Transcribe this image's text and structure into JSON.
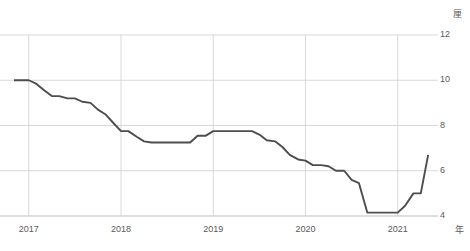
{
  "chart_data": {
    "type": "line",
    "title": "",
    "xlabel": "年",
    "ylabel": "厘",
    "unit_y": "厘",
    "unit_x": "年",
    "grid": true,
    "legend": "none",
    "xlim": [
      2016.84,
      2021.35
    ],
    "ylim": [
      4,
      12
    ],
    "yticks": [
      12,
      10,
      8,
      6,
      4
    ],
    "ytick_labels": [
      "12",
      "10",
      "8",
      "6",
      "4"
    ],
    "xticks": [
      2017,
      2018,
      2019,
      2020,
      2021
    ],
    "xtick_labels": [
      "2017",
      "2018",
      "2019",
      "2020",
      "2021"
    ],
    "series": [
      {
        "name": "金利",
        "color": "#4d4d4d",
        "x": [
          2016.84,
          2016.92,
          2017.0,
          2017.08,
          2017.17,
          2017.25,
          2017.33,
          2017.42,
          2017.5,
          2017.58,
          2017.67,
          2017.75,
          2017.83,
          2017.92,
          2018.0,
          2018.08,
          2018.17,
          2018.25,
          2018.33,
          2018.42,
          2018.5,
          2018.58,
          2018.67,
          2018.75,
          2018.83,
          2018.92,
          2019.0,
          2019.08,
          2019.17,
          2019.25,
          2019.33,
          2019.42,
          2019.5,
          2019.58,
          2019.67,
          2019.75,
          2019.83,
          2019.92,
          2020.0,
          2020.08,
          2020.17,
          2020.25,
          2020.33,
          2020.42,
          2020.5,
          2020.58,
          2020.67,
          2020.75,
          2020.83,
          2020.92,
          2021.0,
          2021.08,
          2021.17,
          2021.25,
          2021.33
        ],
        "y": [
          10.0,
          10.0,
          10.0,
          9.85,
          9.55,
          9.3,
          9.3,
          9.2,
          9.2,
          9.05,
          9.0,
          8.7,
          8.5,
          8.1,
          7.75,
          7.75,
          7.5,
          7.3,
          7.25,
          7.25,
          7.25,
          7.25,
          7.25,
          7.25,
          7.55,
          7.55,
          7.75,
          7.75,
          7.75,
          7.75,
          7.75,
          7.75,
          7.6,
          7.35,
          7.3,
          7.05,
          6.7,
          6.5,
          6.45,
          6.25,
          6.25,
          6.2,
          6.0,
          6.0,
          5.6,
          5.45,
          4.15,
          4.15,
          4.15,
          4.15,
          4.15,
          4.45,
          5.0,
          5.0,
          6.7
        ]
      }
    ],
    "annotations": []
  },
  "axis": {
    "unit_y_label": "厘",
    "unit_x_label": "年"
  },
  "style": {
    "line_color": "#4d4d4d",
    "grid_color": "#cfcfcf",
    "axis_color": "#bdbdbd",
    "text_color": "#5a5a5a",
    "background": "#ffffff"
  }
}
